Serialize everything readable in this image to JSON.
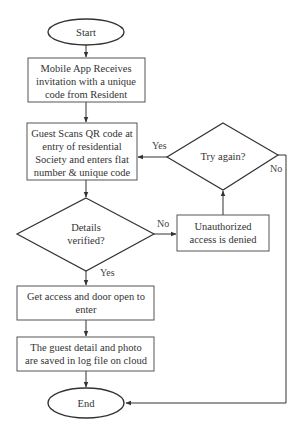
{
  "diagram": {
    "type": "flowchart",
    "nodes": {
      "start": {
        "label": "Start",
        "shape": "ellipse"
      },
      "receive_invite": {
        "lines": [
          "Mobile App Receives",
          "invitation with a unique",
          "code from Resident"
        ],
        "shape": "rectangle"
      },
      "guest_scans": {
        "lines": [
          "Guest Scans QR code at",
          "entry of residential",
          "Society and enters flat",
          "number & unique code"
        ],
        "shape": "rectangle"
      },
      "details_verified": {
        "lines": [
          "Details",
          "verified?"
        ],
        "shape": "diamond"
      },
      "unauthorized": {
        "lines": [
          "Unauthorized",
          "access is denied"
        ],
        "shape": "rectangle"
      },
      "try_again": {
        "label": "Try again?",
        "shape": "diamond"
      },
      "get_access": {
        "lines": [
          "Get access and door open to",
          "enter"
        ],
        "shape": "rectangle"
      },
      "log_saved": {
        "lines": [
          "The guest detail and photo",
          "are saved in log file on cloud"
        ],
        "shape": "rectangle"
      },
      "end": {
        "label": "End",
        "shape": "ellipse"
      }
    },
    "edge_labels": {
      "verified_yes": "Yes",
      "verified_no": "No",
      "try_again_yes": "Yes",
      "try_again_no": "No"
    },
    "edges": [
      {
        "from": "start",
        "to": "receive_invite"
      },
      {
        "from": "receive_invite",
        "to": "guest_scans"
      },
      {
        "from": "guest_scans",
        "to": "details_verified"
      },
      {
        "from": "details_verified",
        "to": "get_access",
        "label": "Yes"
      },
      {
        "from": "details_verified",
        "to": "unauthorized",
        "label": "No"
      },
      {
        "from": "unauthorized",
        "to": "try_again"
      },
      {
        "from": "try_again",
        "to": "guest_scans",
        "label": "Yes"
      },
      {
        "from": "try_again",
        "to": "end",
        "label": "No"
      },
      {
        "from": "get_access",
        "to": "log_saved"
      },
      {
        "from": "log_saved",
        "to": "end"
      }
    ]
  }
}
